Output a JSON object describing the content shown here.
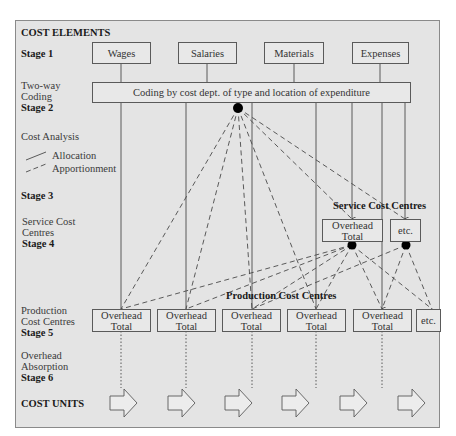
{
  "title": "COST ELEMENTS",
  "stages": {
    "stage1": "Stage 1",
    "stage2_line1": "Two-way",
    "stage2_line2": "Coding",
    "stage2": "Stage 2",
    "analysis": "Cost Analysis",
    "legend_allocation": "Allocation",
    "legend_apportionment": "Apportionment",
    "stage3": "Stage 3",
    "stage4_line1": "Service Cost",
    "stage4_line2": "Centres",
    "stage4": "Stage 4",
    "stage5_line1": "Production",
    "stage5_line2": "Cost Centres",
    "stage5": "Stage 5",
    "stage6_line1": "Overhead",
    "stage6_line2": "Absorption",
    "stage6": "Stage 6",
    "cost_units": "COST UNITS"
  },
  "cost_elements": [
    "Wages",
    "Salaries",
    "Materials",
    "Expenses"
  ],
  "coding_box": "Coding by cost dept. of type and location of expenditure",
  "service_heading": "Service Cost Centres",
  "service_boxes": [
    {
      "line1": "Overhead",
      "line2": "Total"
    },
    {
      "line1": "etc.",
      "line2": ""
    }
  ],
  "production_heading": "Production Cost Centres",
  "production_boxes": [
    {
      "line1": "Overhead",
      "line2": "Total"
    },
    {
      "line1": "Overhead",
      "line2": "Total"
    },
    {
      "line1": "Overhead",
      "line2": "Total"
    },
    {
      "line1": "Overhead",
      "line2": "Total"
    },
    {
      "line1": "Overhead",
      "line2": "Total"
    },
    {
      "line1": "etc.",
      "line2": ""
    }
  ],
  "cost_unit_arrows": 6,
  "colors": {
    "background": "#e4e4e4",
    "line": "#4a4a4a",
    "node": "#000000"
  }
}
